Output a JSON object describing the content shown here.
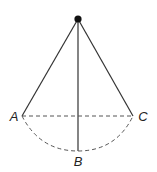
{
  "diagram": {
    "type": "pendulum",
    "pivot": {
      "x": 78,
      "y": 19
    },
    "points": [
      {
        "id": "A",
        "label": "A",
        "x": 22,
        "y": 116,
        "label_x": 14,
        "label_y": 121
      },
      {
        "id": "B",
        "label": "B",
        "x": 78,
        "y": 151,
        "label_x": 78,
        "label_y": 166
      },
      {
        "id": "C",
        "label": "C",
        "x": 133,
        "y": 116,
        "label_x": 143,
        "label_y": 121
      }
    ],
    "colors": {
      "line": "#333333",
      "dashed": "#555555",
      "pivot": "#111111",
      "background": "#ffffff"
    }
  }
}
